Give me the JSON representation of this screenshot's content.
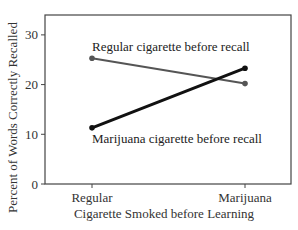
{
  "chart_data": {
    "type": "line",
    "title": "",
    "xlabel": "Cigarette Smoked before Learning",
    "ylabel": "Percent of Words Correctly Recalled",
    "categories": [
      "Regular",
      "Marijuana"
    ],
    "ylim": [
      0,
      34
    ],
    "yticks": [
      0,
      10,
      20,
      30
    ],
    "grid": false,
    "legend": "inline annotations",
    "series": [
      {
        "name": "Regular cigarette before recall",
        "values": [
          25.3,
          20.2
        ],
        "color": "#555555",
        "width": 2
      },
      {
        "name": "Marijuana cigarette before recall",
        "values": [
          11.3,
          23.3
        ],
        "color": "#111111",
        "width": 3
      }
    ],
    "annotations": [
      {
        "text": "Regular cigarette before recall",
        "x": 92,
        "y": 51
      },
      {
        "text": "Marijuana cigarette before recall",
        "x": 92,
        "y": 143
      }
    ]
  },
  "layout": {
    "plot": {
      "left": 45,
      "top": 15,
      "right": 291,
      "bottom": 184
    },
    "x_positions": [
      92,
      245
    ]
  }
}
